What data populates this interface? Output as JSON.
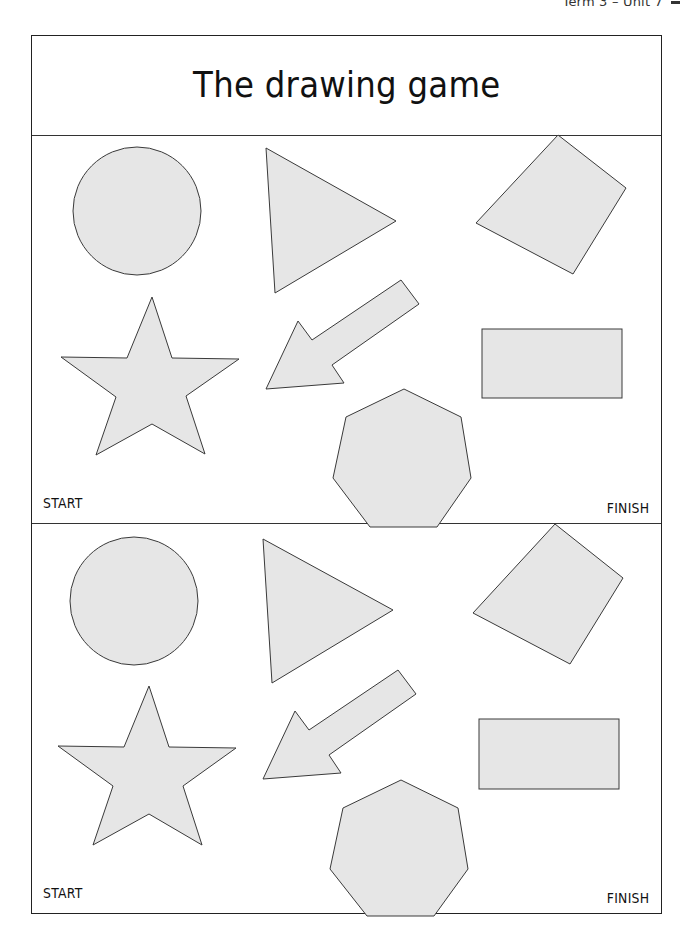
{
  "running_head": "Term 3 – Unit 7",
  "title": "The drawing game",
  "panels": [
    {
      "start_label": "START",
      "finish_label": "FINISH",
      "shapes": [
        "circle",
        "triangle",
        "square",
        "star",
        "arrow",
        "rectangle",
        "heptagon"
      ]
    },
    {
      "start_label": "START",
      "finish_label": "FINISH",
      "shapes": [
        "circle",
        "triangle",
        "square",
        "star",
        "arrow",
        "rectangle",
        "heptagon"
      ]
    }
  ],
  "colors": {
    "shape_fill": "#e6e6e6",
    "shape_stroke": "#3a3a3a",
    "border": "#222222"
  }
}
